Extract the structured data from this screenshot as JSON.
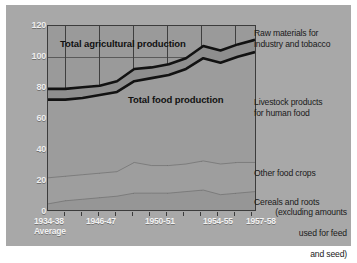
{
  "chart_data": {
    "type": "area",
    "title": "",
    "subtitle": "",
    "xlabel": "",
    "ylabel": "",
    "ylim": [
      0,
      120
    ],
    "yticks": [
      0,
      20,
      40,
      60,
      80,
      100,
      120
    ],
    "grid": true,
    "legend_position": "right",
    "x": [
      "1934-38 Average",
      "1946-47",
      "1947-48",
      "1948-49",
      "1949-50",
      "1950-51",
      "1951-52",
      "1952-53",
      "1953-54",
      "1954-55",
      "1955-56",
      "1956-57",
      "1957-58"
    ],
    "xtick_labels": [
      "1934-38",
      "1946-47",
      "1950-51",
      "1954-55",
      "1957-58"
    ],
    "xtick_sublabel": "Average",
    "series": [
      {
        "name": "Total agricultural production",
        "values": [
          79,
          79,
          80,
          81,
          84,
          92,
          93,
          95,
          99,
          107,
          104,
          108,
          111
        ],
        "style": "thick-line"
      },
      {
        "name": "Total food production",
        "values": [
          72,
          72,
          73,
          75,
          77,
          84,
          86,
          88,
          92,
          99,
          96,
          100,
          103
        ],
        "style": "thick-line"
      },
      {
        "name": "Other food crops + Cereals and roots (upper boundary)",
        "values": [
          21,
          22,
          23,
          24,
          25,
          31,
          29,
          29,
          30,
          32,
          30,
          31,
          31
        ],
        "style": "faint-line"
      },
      {
        "name": "Cereals and roots",
        "values": [
          4,
          6,
          7,
          8,
          9,
          11,
          11,
          11,
          12,
          13,
          10,
          11,
          12
        ],
        "style": "faint-line"
      }
    ],
    "bands": [
      {
        "name": "Raw materials for industry and tobacco",
        "between": [
          "Total food production",
          "Total agricultural production"
        ]
      },
      {
        "name": "Livestock products for human food",
        "between": [
          "Other food crops + Cereals and roots (upper boundary)",
          "Total food production"
        ]
      },
      {
        "name": "Other food crops",
        "between": [
          "Cereals and roots",
          "Other food crops + Cereals and roots (upper boundary)"
        ]
      },
      {
        "name": "Cereals and roots (excluding amounts used for feed and seed)",
        "between": [
          "zero",
          "Cereals and roots"
        ]
      }
    ],
    "annotations": [
      {
        "text": "Total agricultural production",
        "x": "1946-47",
        "y": 112
      },
      {
        "text": "Total food production",
        "x": "1950-51",
        "y": 70
      }
    ]
  },
  "yaxis": {
    "ticks": [
      "120",
      "100",
      "80",
      "60",
      "40",
      "20",
      "0"
    ]
  },
  "xaxis": {
    "labels": [
      {
        "main": "1934-38",
        "sub": "Average"
      },
      {
        "main": "1946-47",
        "sub": ""
      },
      {
        "main": "1950-51",
        "sub": ""
      },
      {
        "main": "1954-55",
        "sub": ""
      },
      {
        "main": "1957-58",
        "sub": ""
      }
    ]
  },
  "plot_labels": {
    "agricultural": "Total agricultural production",
    "food": "Total food production"
  },
  "legend": {
    "raw_materials": "Raw materials for\nindustry and tobacco",
    "livestock": "Livestock products\nfor human food",
    "other_food_crops": "Other food crops",
    "cereals_main": "Cereals and roots",
    "cereals_line2": "(excluding amounts",
    "cereals_line3": "used for feed",
    "cereals_line4": "and seed)"
  },
  "colors": {
    "plate_background": "#a8a8a8",
    "plot_background": "#9a9a9a",
    "grid": "#3f3f3f",
    "line": "#121212",
    "faint_line": "#6d6d6d",
    "tick_label": "#efefef",
    "legend_text": "#1a1a1a"
  }
}
